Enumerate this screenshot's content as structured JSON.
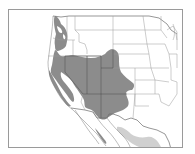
{
  "map": {
    "region": "Western North America",
    "extent": "Western United States and northern Mexico",
    "colors": {
      "background": "#ffffff",
      "frame": "#9a9a9a",
      "borders": "#8a8a8a",
      "primary_range": "#8c8c8c",
      "secondary_range": "#d0d0d0"
    },
    "layers": [
      {
        "name": "primary-range",
        "color": "#8c8c8c",
        "description": "Dark gray distribution covering Pacific Northwest coast, Great Basin, Colorado Plateau and southern Rockies"
      },
      {
        "name": "secondary-range",
        "color": "#d0d0d0",
        "description": "Light gray distribution in northwestern Mexico (Sierra Madre Occidental)"
      }
    ]
  }
}
